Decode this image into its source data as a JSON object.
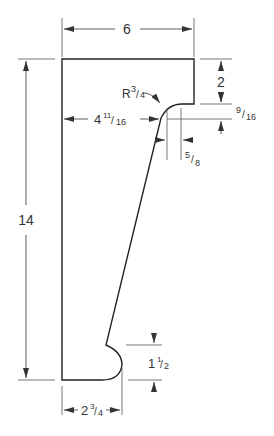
{
  "drawing": {
    "type": "corbel/bracket profile technical drawing",
    "units": "inches",
    "dimensions": {
      "overall_width": "6",
      "overall_height": "14",
      "notch_depth": "2",
      "fillet_radius_label": "R",
      "fillet_radius_value": "3/4",
      "fillet_radius_num": "3",
      "fillet_radius_den": "4",
      "offset_to_slope": "4",
      "offset_to_slope_num": "11",
      "offset_to_slope_den": "16",
      "small_vertical": "9/16",
      "small_vertical_num": "9",
      "small_vertical_den": "16",
      "small_horizontal": "5/8",
      "small_horizontal_num": "5",
      "small_horizontal_den": "8",
      "bottom_arc_height": "1",
      "bottom_arc_height_num": "1",
      "bottom_arc_height_den": "2",
      "base_width": "2",
      "base_width_num": "3",
      "base_width_den": "4"
    },
    "colors": {
      "outline": "#222222",
      "dim_line": "#555555",
      "background": "#ffffff"
    }
  }
}
